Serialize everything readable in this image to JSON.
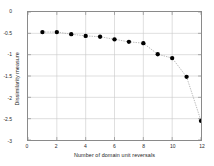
{
  "chart_data": {
    "type": "line",
    "title": "",
    "xlabel": "Number of domain unit reversals",
    "ylabel": "Dissimilarity measure",
    "xlim": [
      0,
      12
    ],
    "ylim": [
      -3,
      0
    ],
    "xticks": [
      0,
      2,
      4,
      6,
      8,
      10,
      12
    ],
    "xticklabels": [
      "0",
      "2",
      "4",
      "6",
      "8",
      "10",
      "12"
    ],
    "yticks": [
      0,
      -0.5,
      -1,
      -1.5,
      -2,
      -2.5,
      -3
    ],
    "yticklabels": [
      "0",
      "-0.5",
      "-1",
      "-1.5",
      "-2",
      "-2.5",
      "-3"
    ],
    "grid": true,
    "legend": null,
    "marker": "filled-circle",
    "marker_color": "#000000",
    "line_color": "#999999",
    "line_style": "dotted-to-solid",
    "x": [
      1,
      2,
      3,
      4,
      5,
      6,
      7,
      8,
      9,
      10,
      11,
      12
    ],
    "values": [
      -0.47,
      -0.47,
      -0.52,
      -0.56,
      -0.58,
      -0.64,
      -0.7,
      -0.73,
      -0.99,
      -1.08,
      -1.52,
      -2.55
    ],
    "series": [
      {
        "name": "dissimilarity",
        "x": [
          1,
          2,
          3,
          4,
          5,
          6,
          7,
          8,
          9,
          10,
          11,
          12
        ],
        "values": [
          -0.47,
          -0.47,
          -0.52,
          -0.56,
          -0.58,
          -0.64,
          -0.7,
          -0.73,
          -0.99,
          -1.08,
          -1.52,
          -2.55
        ]
      }
    ]
  },
  "colors": {
    "axis": "#8a8a8a",
    "grid": "#c9c9c9",
    "marker": "#000000",
    "line": "#9a9a9a",
    "text": "#1d1d1d",
    "background": "#ffffff"
  }
}
